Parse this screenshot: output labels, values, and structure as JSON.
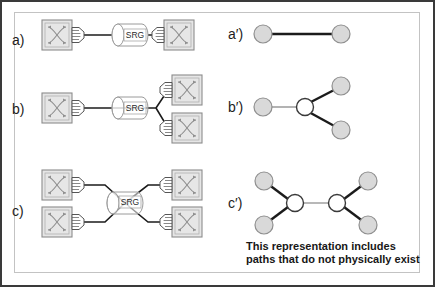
{
  "figure": {
    "background_color": "#ffffff",
    "outer_border_color": "#3a3a3a",
    "inner_border_color": "#c3c3c3"
  },
  "colors": {
    "line": "#1b1b1b",
    "thin_line": "#9a9a9a",
    "switch_fill": "#e6e6e6",
    "switch_stroke": "#8c8c8c",
    "switch_inner_stroke": "#b0b0b0",
    "connector_fill": "#ffffff",
    "connector_stroke": "#555555",
    "srg_fill": "#ffffff",
    "srg_stroke": "#9a9a9a",
    "node_fill": "#d9d9d9",
    "node_stroke": "#8f8f8f",
    "junction_fill": "#ffffff",
    "junction_stroke": "#3a3a3a",
    "text": "#1c1c1c"
  },
  "labels": {
    "physical": [
      {
        "id": "a",
        "text": "a)",
        "x": 12,
        "y": 32
      },
      {
        "id": "b",
        "text": "b)",
        "x": 12,
        "y": 101
      },
      {
        "id": "c",
        "text": "c)",
        "x": 12,
        "y": 203
      }
    ],
    "logical": [
      {
        "id": "a-prime",
        "text": "a′)",
        "x": 228,
        "y": 26
      },
      {
        "id": "b-prime",
        "text": "b′)",
        "x": 228,
        "y": 100
      },
      {
        "id": "c-prime",
        "text": "c′)",
        "x": 228,
        "y": 198
      }
    ]
  },
  "srg": {
    "label": "SRG",
    "instances": [
      {
        "row": "a",
        "cx": 130,
        "cy": 35
      },
      {
        "row": "b",
        "cx": 130,
        "cy": 108
      },
      {
        "row": "c",
        "cx": 125,
        "cy": 203
      }
    ]
  },
  "switches": {
    "icon_name": "optical-switch-icon",
    "count_row_a": 2,
    "count_row_b": 3,
    "count_row_c": 4
  },
  "caption": {
    "line1": "This representation includes",
    "line2": "paths that do not physically exist"
  },
  "diagram_data": {
    "type": "diagram",
    "description": "Three physical optical network topologies (a, b, c) on the left, each using a Shared Risk Group (SRG) fiber bundle between optical switches, and their corresponding logical graph representations (a', b', c') on the right.",
    "rows": [
      {
        "id": "a",
        "physical": {
          "switches": 2,
          "srg_count": 1,
          "topology": "point-to-point: switch -- SRG -- switch"
        },
        "logical": {
          "nodes": 2,
          "node_types": [
            "endpoint",
            "endpoint"
          ],
          "edges": 1,
          "junctions": 0,
          "topology": "two endpoint nodes joined by a single edge"
        }
      },
      {
        "id": "b",
        "physical": {
          "switches": 3,
          "srg_count": 1,
          "topology": "one switch -- SRG -- fiber splits to two switches"
        },
        "logical": {
          "nodes": 3,
          "node_types": [
            "endpoint",
            "endpoint",
            "endpoint"
          ],
          "edges": 3,
          "junctions": 1,
          "topology": "one endpoint to a hollow junction which branches to two endpoints"
        }
      },
      {
        "id": "c",
        "physical": {
          "switches": 4,
          "srg_count": 1,
          "topology": "two switches converge into SRG then diverge to two switches"
        },
        "logical": {
          "nodes": 4,
          "node_types": [
            "endpoint",
            "endpoint",
            "endpoint",
            "endpoint"
          ],
          "edges": 5,
          "junctions": 2,
          "topology": "two endpoints to left junction, junction-to-junction edge, right junction to two endpoints"
        },
        "note": "This representation includes paths that do not physically exist"
      }
    ]
  }
}
